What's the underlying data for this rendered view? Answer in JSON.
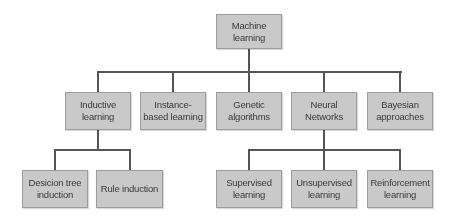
{
  "diagram": {
    "type": "tree",
    "root": {
      "id": "machine_learning",
      "label": "Machine learning"
    },
    "level2": [
      {
        "id": "inductive_learning",
        "label": "Inductive learning"
      },
      {
        "id": "instance_based_learning",
        "label": "Instance-based learning"
      },
      {
        "id": "genetic_algorithms",
        "label": "Genetic algorithms"
      },
      {
        "id": "neural_networks",
        "label": "Neural Networks"
      },
      {
        "id": "bayesian_approaches",
        "label": "Bayesian approaches"
      }
    ],
    "level3_inductive": [
      {
        "id": "decision_tree_induction",
        "label": "Desicion tree induction"
      },
      {
        "id": "rule_induction",
        "label": "Rule induction"
      }
    ],
    "level3_neural": [
      {
        "id": "supervised_learning",
        "label": "Supervised learning"
      },
      {
        "id": "unsupervised_learning",
        "label": "Unsupervised learning"
      },
      {
        "id": "reinforcement_learning",
        "label": "Reinforcement learning"
      }
    ],
    "edges": [
      [
        "machine_learning",
        "inductive_learning"
      ],
      [
        "machine_learning",
        "instance_based_learning"
      ],
      [
        "machine_learning",
        "genetic_algorithms"
      ],
      [
        "machine_learning",
        "neural_networks"
      ],
      [
        "machine_learning",
        "bayesian_approaches"
      ],
      [
        "inductive_learning",
        "decision_tree_induction"
      ],
      [
        "inductive_learning",
        "rule_induction"
      ],
      [
        "neural_networks",
        "supervised_learning"
      ],
      [
        "neural_networks",
        "unsupervised_learning"
      ],
      [
        "neural_networks",
        "reinforcement_learning"
      ]
    ],
    "colors": {
      "node_fill": "#c9c9c9",
      "node_border": "#9c9c9c",
      "text": "#3a3a3a",
      "connector": "#555555"
    }
  }
}
